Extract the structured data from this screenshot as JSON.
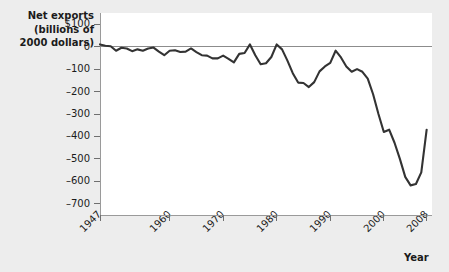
{
  "chart_data": {
    "type": "line",
    "title": "Net exports (billions of 2000 dollars)",
    "ylabel": "Net exports\n(billions of\n2000 dollars)",
    "xlabel": "Year",
    "grid": false,
    "legend": "none",
    "zero_line": true,
    "ylim": [
      -750,
      150
    ],
    "xlim": [
      1947,
      2009
    ],
    "y_tick_labels": [
      "$100",
      "0",
      "-100",
      "-200",
      "-300",
      "-400",
      "-500",
      "-600",
      "-700"
    ],
    "y_tick_values": [
      100,
      0,
      -100,
      -200,
      -300,
      -400,
      -500,
      -600,
      -700
    ],
    "x_tick_labels": [
      "1947",
      "1960",
      "1970",
      "1980",
      "1990",
      "2000",
      "2008"
    ],
    "x_tick_values": [
      1947,
      1960,
      1970,
      1980,
      1990,
      2000,
      2008
    ],
    "series": [
      {
        "name": "Net exports",
        "color": "#333333",
        "x": [
          1947,
          1948,
          1949,
          1950,
          1951,
          1952,
          1953,
          1954,
          1955,
          1956,
          1957,
          1958,
          1959,
          1960,
          1961,
          1962,
          1963,
          1964,
          1965,
          1966,
          1967,
          1968,
          1969,
          1970,
          1971,
          1972,
          1973,
          1974,
          1975,
          1976,
          1977,
          1978,
          1979,
          1980,
          1981,
          1982,
          1983,
          1984,
          1985,
          1986,
          1987,
          1988,
          1989,
          1990,
          1991,
          1992,
          1993,
          1994,
          1995,
          1996,
          1997,
          1998,
          1999,
          2000,
          2001,
          2002,
          2003,
          2004,
          2005,
          2006,
          2007,
          2008
        ],
        "values": [
          10,
          4,
          2,
          -18,
          -5,
          -8,
          -20,
          -12,
          -18,
          -8,
          -4,
          -22,
          -38,
          -18,
          -16,
          -24,
          -22,
          -8,
          -24,
          -38,
          -40,
          -52,
          -52,
          -40,
          -54,
          -70,
          -32,
          -28,
          10,
          -38,
          -78,
          -74,
          -46,
          10,
          -12,
          -62,
          -118,
          -160,
          -162,
          -180,
          -158,
          -110,
          -88,
          -72,
          -18,
          -48,
          -88,
          -112,
          -100,
          -112,
          -142,
          -212,
          -300,
          -380,
          -370,
          -428,
          -500,
          -580,
          -618,
          -612,
          -560,
          -370
        ]
      }
    ]
  },
  "axis": {
    "y_title": "Net exports\n(billions of\n2000 dollars)",
    "x_title": "Year"
  }
}
